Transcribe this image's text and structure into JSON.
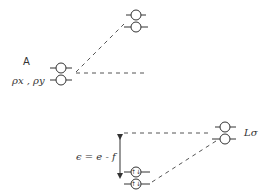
{
  "diagram": {
    "labels": {
      "A": "A",
      "p_orbitals": "ρx , ρy",
      "energy": "ϵ = e - f",
      "L_sigma": "Lσ"
    },
    "levels": [
      {
        "id": "left-upper",
        "electrons": ""
      },
      {
        "id": "left-lower",
        "electrons": ""
      },
      {
        "id": "top-upper",
        "electrons": ""
      },
      {
        "id": "top-lower",
        "electrons": ""
      },
      {
        "id": "bottom-upper",
        "electrons": "↑↓"
      },
      {
        "id": "bottom-lower",
        "electrons": "↑↓"
      },
      {
        "id": "right-upper",
        "electrons": ""
      },
      {
        "id": "right-lower",
        "electrons": ""
      }
    ]
  }
}
